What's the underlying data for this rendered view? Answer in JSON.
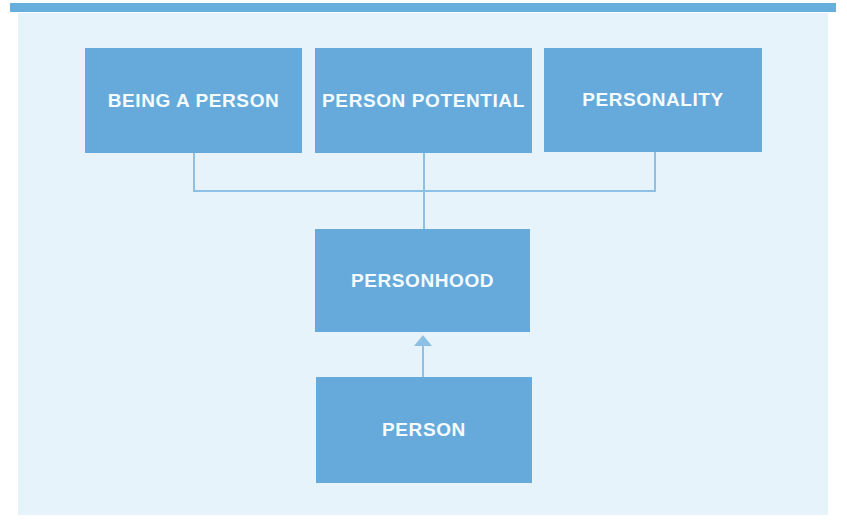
{
  "diagram": {
    "nodes": {
      "being_a_person": {
        "label": "BEING A PERSON"
      },
      "person_potential": {
        "label": "PERSON POTENTIAL"
      },
      "personality": {
        "label": "PERSONALITY"
      },
      "personhood": {
        "label": "PERSONHOOD"
      },
      "person": {
        "label": "PERSON"
      }
    },
    "edges": [
      {
        "from": "being_a_person",
        "to": "personhood",
        "style": "plain"
      },
      {
        "from": "person_potential",
        "to": "personhood",
        "style": "plain"
      },
      {
        "from": "personality",
        "to": "personhood",
        "style": "plain"
      },
      {
        "from": "person",
        "to": "personhood",
        "style": "arrow-up"
      }
    ]
  },
  "colors": {
    "node-fill": "#66aadb",
    "node-text": "#f5fbfe",
    "panel-bg": "#e6f3fa",
    "connector": "#8cc0e5",
    "top-strip": "#55a5d8"
  }
}
